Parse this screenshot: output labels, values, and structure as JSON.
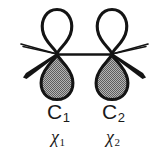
{
  "figure": {
    "background_color": "#ffffff",
    "width": 163,
    "height": 161
  },
  "colors": {
    "stroke": "#141414",
    "lobe_upper_fill": "#ffffff",
    "lobe_lower_fill": "#8a8a8a",
    "text": "#1a1a1a",
    "bond": "#141414"
  },
  "atoms": [
    {
      "id": "c1",
      "element_label": "C",
      "index_label": "1",
      "orbital_symbol": "χ",
      "orbital_index_label": "1",
      "node_x": 57,
      "node_y": 54
    },
    {
      "id": "c2",
      "element_label": "C",
      "index_label": "2",
      "orbital_symbol": "χ",
      "orbital_index_label": "2",
      "node_x": 112,
      "node_y": 54
    }
  ],
  "bonds": {
    "carbon_carbon_label": "C–C sigma bond",
    "wedge_label": "bold wedge bond",
    "line_label": "plain line bond"
  },
  "icons": {
    "upper_lobe": "orbital-lobe-upper-icon",
    "lower_lobe": "orbital-lobe-lower-icon"
  }
}
